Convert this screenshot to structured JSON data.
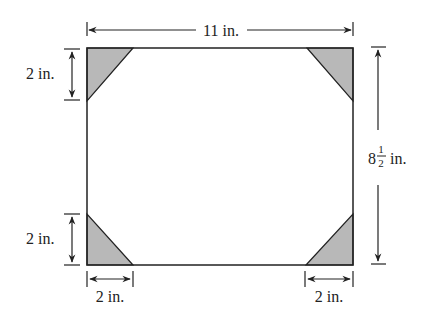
{
  "diagram": {
    "type": "dimensioned-rectangle-with-corner-cutouts",
    "labels": {
      "width": "11 in.",
      "height_whole": "8",
      "height_frac_num": "1",
      "height_frac_den": "2",
      "height_unit": "in.",
      "top_left_corner": "2 in.",
      "bottom_left_corner_vertical": "2 in.",
      "bottom_left_corner_horizontal": "2 in.",
      "bottom_right_corner_horizontal": "2 in."
    },
    "colors": {
      "stroke": "#222222",
      "corner_fill": "#b8b8b8",
      "background": "#ffffff"
    }
  }
}
